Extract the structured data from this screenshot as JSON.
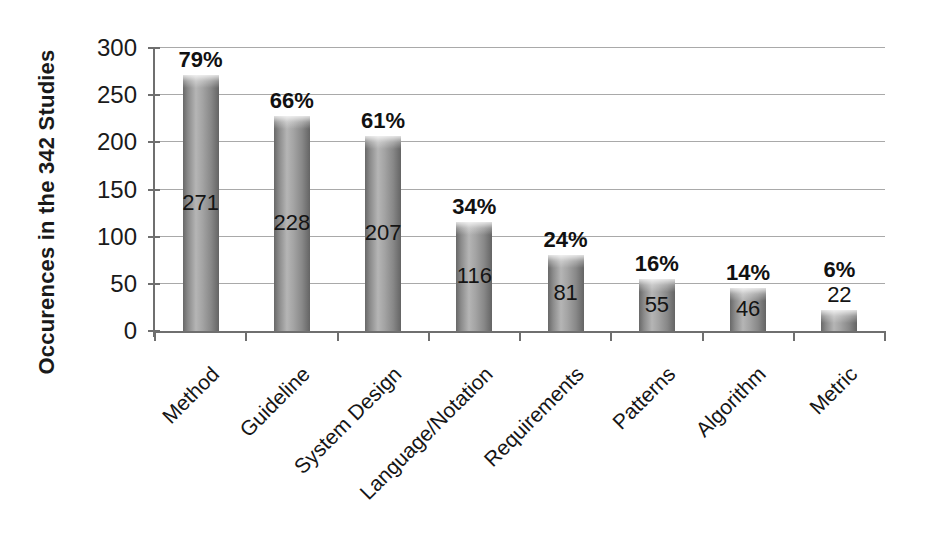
{
  "chart_data": {
    "type": "bar",
    "title": "",
    "xlabel": "",
    "ylabel": "Occurences in the 342 Studies",
    "categories": [
      "Method",
      "Guideline",
      "System Design",
      "Language/Notation",
      "Requirements",
      "Patterns",
      "Algorithm",
      "Metric"
    ],
    "values": [
      271,
      228,
      207,
      116,
      81,
      55,
      46,
      22
    ],
    "value_labels": [
      "271",
      "228",
      "207",
      "116",
      "81",
      "55",
      "46",
      "22"
    ],
    "percent_labels": [
      "79%",
      "66%",
      "61%",
      "34%",
      "24%",
      "16%",
      "14%",
      "6%"
    ],
    "yticks": [
      0,
      50,
      100,
      150,
      200,
      250,
      300
    ],
    "ylim": [
      0,
      300
    ],
    "grid": true,
    "legend": "none",
    "x_label_rotation_deg": -45
  },
  "colors": {
    "background": "#ffffff",
    "bar_fill": "#919191",
    "bar_highlight": "#b5b5b5",
    "bar_edge": "#666666",
    "gridline": "#a9a9a9",
    "axis": "#6f6f6f",
    "text": "#1a1a1a"
  }
}
